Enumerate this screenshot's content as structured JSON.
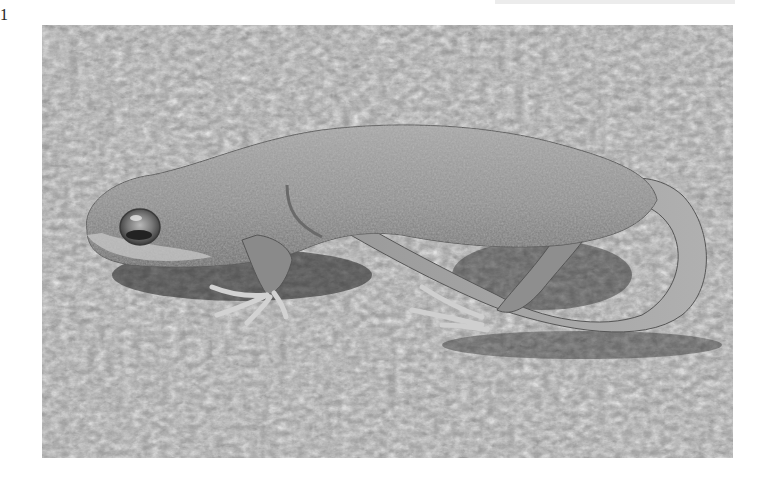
{
  "page": {
    "marker": "1"
  },
  "photo": {
    "subject": "newt resting on moss",
    "style": "grayscale photograph",
    "colors": {
      "moss_light": "#d8d8d8",
      "moss_dark": "#3a3a3a",
      "body": "#8e8e8e",
      "body_highlight": "#bdbdbd",
      "shadow": "#1e1e1e"
    }
  }
}
